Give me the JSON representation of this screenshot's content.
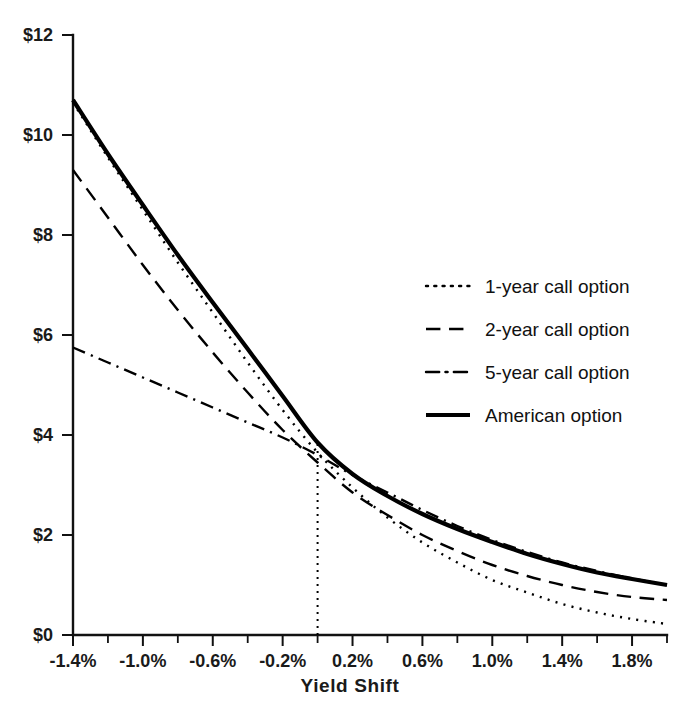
{
  "chart_data": {
    "type": "line",
    "title": "",
    "xlabel": "Yield Shift",
    "ylabel": "",
    "xlim": [
      -1.4,
      2.0
    ],
    "ylim": [
      0,
      12
    ],
    "grid": false,
    "legend_position": "center-right",
    "x_tick_labels": [
      "-1.4%",
      "-1.0%",
      "-0.6%",
      "-0.2%",
      "0.2%",
      "0.6%",
      "1.0%",
      "1.4%",
      "1.8%"
    ],
    "x_tick_values": [
      -1.4,
      -1.0,
      -0.6,
      -0.2,
      0.2,
      0.6,
      1.0,
      1.4,
      1.8
    ],
    "x_minor_tick_values": [
      -1.2,
      -0.8,
      -0.4,
      0.0,
      0.4,
      0.8,
      1.2,
      1.6,
      2.0
    ],
    "y_tick_labels": [
      "$0",
      "$2",
      "$4",
      "$6",
      "$8",
      "$10",
      "$12"
    ],
    "y_tick_values": [
      0,
      2,
      4,
      6,
      8,
      10,
      12
    ],
    "annotations": [
      {
        "name": "zero-yield-shift-reference-line",
        "type": "vline",
        "x": 0.0,
        "y_from": 0.0,
        "y_to": 3.85,
        "style": "dotted"
      }
    ],
    "x": [
      -1.4,
      -1.2,
      -1.0,
      -0.8,
      -0.6,
      -0.4,
      -0.2,
      0.0,
      0.2,
      0.4,
      0.6,
      0.8,
      1.0,
      1.2,
      1.4,
      1.6,
      1.8,
      2.0
    ],
    "series": [
      {
        "name": "1-year call option",
        "style": "dotted",
        "width": 2.4,
        "values": [
          10.65,
          9.55,
          8.5,
          7.45,
          6.45,
          5.45,
          4.5,
          3.65,
          2.95,
          2.35,
          1.85,
          1.45,
          1.1,
          0.85,
          0.62,
          0.45,
          0.32,
          0.22
        ]
      },
      {
        "name": "2-year call option",
        "style": "dashed",
        "width": 2.4,
        "values": [
          9.3,
          8.35,
          7.4,
          6.5,
          5.65,
          4.85,
          4.1,
          3.45,
          2.85,
          2.4,
          2.0,
          1.68,
          1.4,
          1.18,
          1.0,
          0.86,
          0.76,
          0.7
        ]
      },
      {
        "name": "5-year call option",
        "style": "dash-dot",
        "width": 2.4,
        "values": [
          5.75,
          5.45,
          5.15,
          4.85,
          4.55,
          4.25,
          3.95,
          3.6,
          3.2,
          2.85,
          2.5,
          2.18,
          1.9,
          1.66,
          1.45,
          1.28,
          1.13,
          1.0
        ]
      },
      {
        "name": "American option",
        "style": "solid",
        "width": 4.2,
        "values": [
          10.7,
          9.62,
          8.6,
          7.6,
          6.65,
          5.72,
          4.78,
          3.85,
          3.22,
          2.78,
          2.42,
          2.12,
          1.86,
          1.62,
          1.42,
          1.25,
          1.12,
          1.0
        ]
      }
    ]
  },
  "legend": {
    "items": [
      {
        "label": "1-year call option",
        "style": "dotted"
      },
      {
        "label": "2-year call option",
        "style": "dashed"
      },
      {
        "label": "5-year call option",
        "style": "dash-dot"
      },
      {
        "label": "American option",
        "style": "solid"
      }
    ]
  },
  "colors": {
    "line": "#000000",
    "axis": "#111111",
    "background": "#ffffff"
  }
}
